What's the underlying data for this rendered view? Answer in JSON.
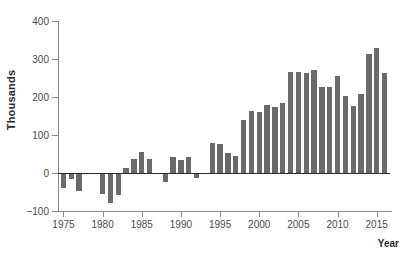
{
  "chart_data": {
    "type": "bar",
    "title": "",
    "subtitle": "",
    "xlabel": "Year",
    "ylabel": "Thousands",
    "ylim": [
      -100,
      400
    ],
    "xlim": [
      1974.3,
      2016.7
    ],
    "grid": false,
    "legend": null,
    "bar_color": "#6a6a6a",
    "axis_color": "#8a8a8a",
    "zero_line_color": "#2b2b2b",
    "y_ticks": [
      400,
      300,
      200,
      100,
      0,
      -100
    ],
    "y_tick_labels": [
      "400",
      "300",
      "200",
      "100",
      "0",
      "−100"
    ],
    "x_ticks": [
      1975,
      1980,
      1985,
      1990,
      1995,
      2000,
      2005,
      2010,
      2015
    ],
    "x_tick_labels": [
      "1975",
      "1980",
      "1985",
      "1990",
      "1995",
      "2000",
      "2005",
      "2010",
      "2015"
    ],
    "categories": [
      "1975",
      "1976",
      "1977",
      "1978",
      "1979",
      "1980",
      "1981",
      "1982",
      "1983",
      "1984",
      "1985",
      "1986",
      "1987",
      "1988",
      "1989",
      "1990",
      "1991",
      "1992",
      "1993",
      "1994",
      "1995",
      "1996",
      "1997",
      "1998",
      "1999",
      "2000",
      "2001",
      "2002",
      "2003",
      "2004",
      "2005",
      "2006",
      "2007",
      "2008",
      "2009",
      "2010",
      "2011",
      "2012",
      "2013",
      "2014",
      "2015",
      "2016"
    ],
    "values": [
      -40,
      -15,
      -47,
      -3,
      0,
      -55,
      -80,
      -57,
      13,
      37,
      56,
      37,
      0,
      -23,
      41,
      33,
      42,
      -12,
      0,
      78,
      76,
      53,
      46,
      140,
      163,
      160,
      179,
      174,
      184,
      266,
      265,
      263,
      270,
      227,
      227,
      256,
      202,
      176,
      208,
      312,
      329,
      262
    ]
  }
}
